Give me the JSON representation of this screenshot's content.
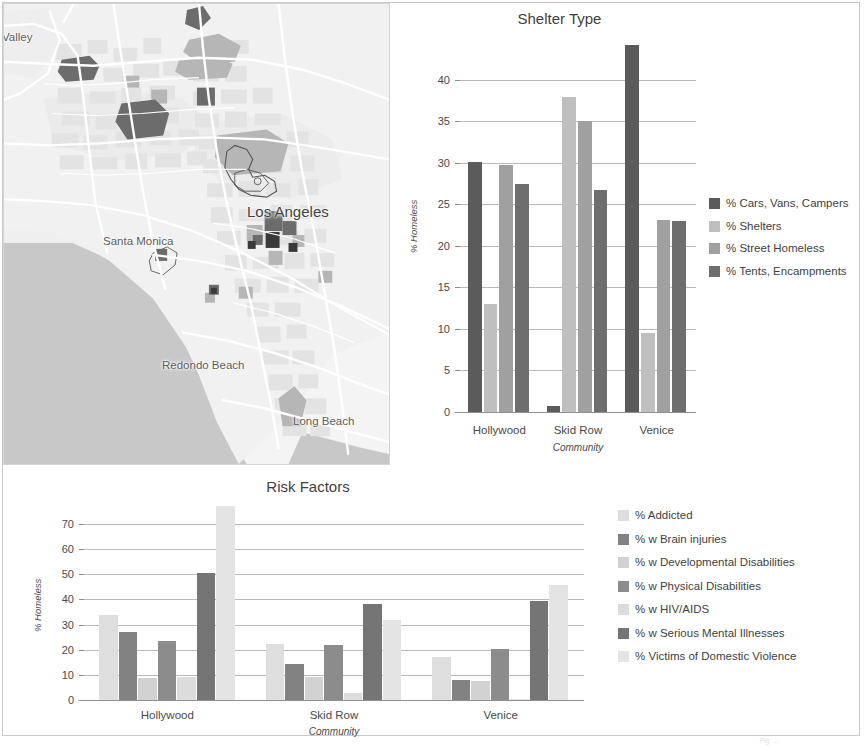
{
  "map": {
    "name": "los-angeles-basin-map",
    "labels": [
      {
        "id": "valley",
        "text": "Valley"
      },
      {
        "id": "los-angeles",
        "text": "Los Angeles"
      },
      {
        "id": "santa-monica",
        "text": "Santa Monica"
      },
      {
        "id": "redondo-beach",
        "text": "Redondo Beach"
      },
      {
        "id": "long-beach",
        "text": "Long Beach"
      }
    ],
    "colors": {
      "land": "#f0f0f0",
      "ocean": "#c6c6c6",
      "road": "#ffffff",
      "tract_light": "#e2e2e2",
      "tract_mid": "#b4b4b4",
      "tract_dark": "#6e6e6e",
      "tract_darkest": "#3d3d3d"
    }
  },
  "footnote": "Fig. ...",
  "chart_data": [
    {
      "id": "shelter-type",
      "type": "bar",
      "title": "Shelter Type",
      "xlabel": "Community",
      "ylabel": "% Homeless",
      "categories": [
        "Hollywood",
        "Skid Row",
        "Venice"
      ],
      "ylim": [
        0,
        45
      ],
      "yticks": [
        0,
        5,
        10,
        15,
        20,
        25,
        30,
        35,
        40
      ],
      "grid": true,
      "legend_position": "right",
      "series": [
        {
          "name": "% Cars, Vans, Campers",
          "color": "#5b5b5b",
          "values": [
            30.1,
            0.7,
            44.2
          ]
        },
        {
          "name": "% Shelters",
          "color": "#bfbfbf",
          "values": [
            13.0,
            37.9,
            9.5
          ]
        },
        {
          "name": "% Street Homeless",
          "color": "#a0a0a0",
          "values": [
            29.7,
            35.0,
            23.1
          ]
        },
        {
          "name": "% Tents, Encampments",
          "color": "#6e6e6e",
          "values": [
            27.4,
            26.7,
            23.0
          ]
        }
      ]
    },
    {
      "id": "risk-factors",
      "type": "bar",
      "title": "Risk Factors",
      "xlabel": "Community",
      "ylabel": "% Homeless",
      "categories": [
        "Hollywood",
        "Skid Row",
        "Venice"
      ],
      "ylim": [
        0,
        78
      ],
      "yticks": [
        0,
        10,
        20,
        30,
        40,
        50,
        60,
        70
      ],
      "grid": true,
      "legend_position": "right",
      "series": [
        {
          "name": "% Addicted",
          "color": "#dedede",
          "values": [
            33.8,
            22.4,
            17.0
          ]
        },
        {
          "name": "% w Brain injuries",
          "color": "#828282",
          "values": [
            27.2,
            14.4,
            8.1
          ]
        },
        {
          "name": "% w Developmental Disabilities",
          "color": "#d2d2d2",
          "values": [
            8.6,
            9.3,
            7.5
          ]
        },
        {
          "name": "% w Physical Disabilities",
          "color": "#8c8c8c",
          "values": [
            23.6,
            21.9,
            20.5
          ]
        },
        {
          "name": "% w HIV/AIDS",
          "color": "#dcdcdc",
          "values": [
            9.3,
            2.9,
            0.4
          ]
        },
        {
          "name": "% w Serious Mental Illnesses",
          "color": "#757575",
          "values": [
            50.5,
            38.3,
            39.4
          ]
        },
        {
          "name": "% Victims of Domestic Violence",
          "color": "#e4e4e4",
          "values": [
            77.3,
            31.8,
            45.8
          ]
        }
      ]
    }
  ]
}
